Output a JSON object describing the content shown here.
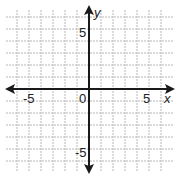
{
  "chart_data": {
    "type": "coordinate-plane",
    "title": "",
    "xlabel": "x",
    "ylabel": "y",
    "xlim": [
      -6.5,
      7.5
    ],
    "ylim": [
      -7.5,
      7
    ],
    "grid": true,
    "grid_step": 1,
    "tick_labels": {
      "x": [
        {
          "value": -5,
          "label": "-5"
        },
        {
          "value": 0,
          "label": "0"
        },
        {
          "value": 5,
          "label": "5"
        }
      ],
      "y": [
        {
          "value": 5,
          "label": "5"
        },
        {
          "value": -5,
          "label": "-5"
        }
      ]
    },
    "series": []
  },
  "labels": {
    "x_axis": "x",
    "y_axis": "y",
    "origin": "0",
    "x_neg5": "-5",
    "x_pos5": "5",
    "y_pos5": "5",
    "y_neg5": "-5"
  },
  "colors": {
    "grid": "#b8b8b8",
    "axis": "#1a1a1a",
    "background": "#ffffff"
  }
}
